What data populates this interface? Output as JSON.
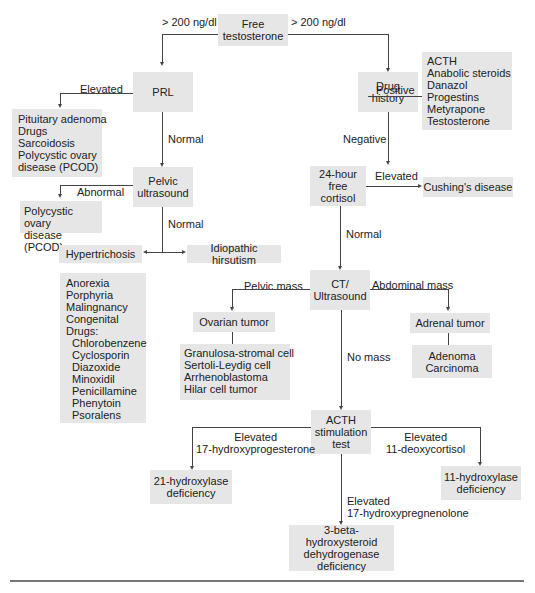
{
  "nodes": {
    "free_testosterone": "Free\ntestosterone",
    "prl": "PRL",
    "pelvic_ultrasound": "Pelvic\nultrasound",
    "drug_history": "Drug\nhistory",
    "cortisol": "24-hour\nfree\ncortisol",
    "cushings": "Cushing's disease",
    "ct_ultrasound": "CT/\nUltrasound",
    "ovarian_tumor": "Ovarian tumor",
    "adrenal_tumor": "Adrenal tumor",
    "acth_test": "ACTH\nstimulation\ntest",
    "hydroxylase21": "21-hydroxylase\ndeficiency",
    "hydroxylase11": "11-hydroxylase\ndeficiency",
    "beta_hsd": "3-beta-hydroxysteroid\ndehydrogenase\ndeficiency",
    "pcod": "Polycystic ovary\ndisease (PCOD)",
    "hypertrichosis": "Hypertrichosis",
    "idiopathic": "Idiopathic hirsutism"
  },
  "lists": {
    "prl_elevated": [
      "Pituitary adenoma",
      "Drugs",
      "Sarcoidosis",
      "Polycystic ovary",
      "disease (PCOD)"
    ],
    "drug_positive": [
      "ACTH",
      "Anabolic steroids",
      "Danazol",
      "Progestins",
      "Metyrapone",
      "Testosterone"
    ],
    "hypertrichosis_causes": [
      "Anorexia",
      "Porphyria",
      "Malingnancy",
      "Congenital",
      "Drugs:"
    ],
    "hypertrichosis_drugs": [
      "Chlorobenzene",
      "Cyclosporin",
      "Diazoxide",
      "Minoxidil",
      "Penicillamine",
      "Phenytoin",
      "Psoralens"
    ],
    "ovarian_types": [
      "Granulosa-stromal cell",
      "Sertoli-Leydig cell",
      "Arrhenoblastoma",
      "Hilar cell tumor"
    ],
    "adrenal_types": [
      "Adenoma",
      "Carcinoma"
    ]
  },
  "edges": {
    "gt200_left": "> 200 ng/dl",
    "gt200_right": "> 200 ng/dl",
    "prl_elevated": "Elevated",
    "prl_normal": "Normal",
    "pelvic_abnormal": "Abnormal",
    "pelvic_normal": "Normal",
    "drug_positive": "Positive",
    "drug_negative": "Negative",
    "cortisol_elevated": "Elevated",
    "cortisol_normal": "Normal",
    "pelvic_mass": "Pelvic mass",
    "abdominal_mass": "Abdominal mass",
    "no_mass": "No mass",
    "elev_17ohp": "Elevated\n17-hydroxyprogesterone",
    "elev_11doc": "Elevated\n11-deoxycortisol",
    "elev_17preg": "Elevated\n17-hydroxypregnenolone"
  }
}
